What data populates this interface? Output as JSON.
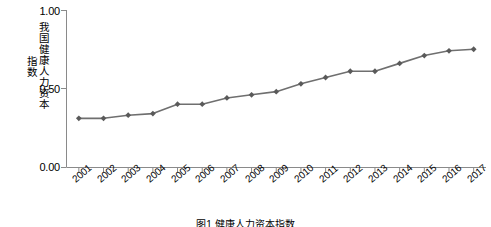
{
  "chart_data": {
    "type": "line",
    "title": "",
    "xlabel": "",
    "ylabel": "我国健康人力资本指数",
    "ylabel_line1": "我国健康人力资本",
    "ylabel_line2": "指数",
    "ylim": [
      0.0,
      1.0
    ],
    "ytick_labels": [
      "0.00",
      "0.50",
      "1.00"
    ],
    "ytick_values": [
      0.0,
      0.5,
      1.0
    ],
    "grid": false,
    "legend": "none",
    "marker": "diamond",
    "line_color": "#6f6f6f",
    "marker_color": "#5a5a5a",
    "axis_color": "#808080",
    "categories": [
      "2001",
      "2002",
      "2003",
      "2004",
      "2005",
      "2006",
      "2007",
      "2008",
      "2009",
      "2010",
      "2011",
      "2012",
      "2013",
      "2014",
      "2015",
      "2016",
      "2017"
    ],
    "values": [
      0.31,
      0.31,
      0.33,
      0.34,
      0.4,
      0.4,
      0.44,
      0.46,
      0.48,
      0.53,
      0.57,
      0.61,
      0.61,
      0.66,
      0.71,
      0.74,
      0.75
    ]
  },
  "caption": "图1  健康人力资本指数"
}
